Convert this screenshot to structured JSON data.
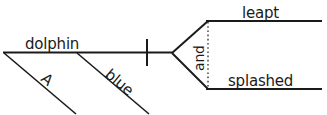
{
  "diagram": {
    "type": "reed-kellogg-sentence-diagram",
    "sentence": "A blue dolphin leapt and splashed.",
    "ink_color": "#1a1a1a",
    "background_color": "#ffffff",
    "subject": {
      "word": "dolphin",
      "role": "subject",
      "position": "main-baseline-left"
    },
    "modifiers": [
      {
        "word": "A",
        "role": "article-modifier",
        "modifies": "dolphin",
        "position": "diagonal-below-left"
      },
      {
        "word": "blue",
        "role": "adjective-modifier",
        "modifies": "dolphin",
        "position": "diagonal-below-right"
      }
    ],
    "divider": {
      "name": "subject-predicate-divider",
      "style": "vertical-bar-crossing-baseline"
    },
    "conjunction": {
      "word": "and",
      "role": "coordinating-conjunction",
      "line_style": "dotted",
      "orientation": "vertical-rotated"
    },
    "compound_predicate": [
      {
        "word": "leapt",
        "role": "verb",
        "position": "upper-branch"
      },
      {
        "word": "splashed",
        "role": "verb",
        "position": "lower-branch"
      }
    ]
  }
}
